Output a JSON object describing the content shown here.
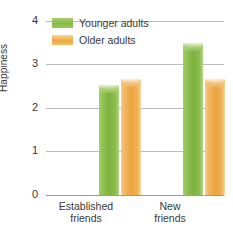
{
  "chart_data": {
    "type": "bar",
    "title": "",
    "xlabel": "",
    "ylabel": "Happiness",
    "ylim": [
      0,
      4
    ],
    "yticks": [
      0,
      1,
      2,
      3,
      4
    ],
    "ytick_labels": [
      "0",
      "1",
      "2",
      "3",
      "4"
    ],
    "grid": true,
    "legend_position": "top-left",
    "categories": [
      "Established friends",
      "New friends"
    ],
    "category_lines": [
      [
        "Established",
        "friends"
      ],
      [
        "New",
        "friends"
      ]
    ],
    "series": [
      {
        "name": "Younger adults",
        "color": "#7cb23f",
        "values": [
          2.53,
          3.49
        ]
      },
      {
        "name": "Older adults",
        "color": "#eda43f",
        "values": [
          2.67,
          2.67
        ]
      }
    ]
  },
  "legend": {
    "items": [
      {
        "label": "Younger adults",
        "swatch": "green"
      },
      {
        "label": "Older adults",
        "swatch": "orange"
      }
    ]
  }
}
